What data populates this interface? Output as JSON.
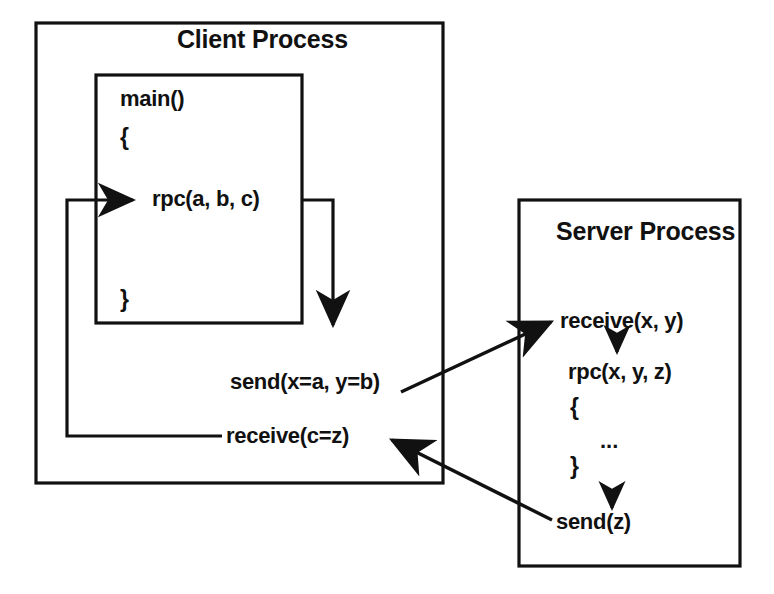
{
  "diagram": {
    "type": "sequence-flow-diagram",
    "background_color": "#ffffff",
    "stroke_color": "#111111",
    "text_color": "#111111"
  },
  "client": {
    "box_label": "Client Process",
    "main_box": {
      "function_label": "main()",
      "open_brace": "{",
      "call_label": "rpc(a, b, c)",
      "close_brace": "}"
    },
    "send_label": "send(x=a, y=b)",
    "receive_label": "receive(c=z)"
  },
  "server": {
    "box_label": "Server Process",
    "receive_label": "receive(x, y)",
    "procedure_label": "rpc(x, y, z)",
    "open_brace": "{",
    "body_ellipsis": "...",
    "close_brace": "}",
    "send_label": "send(z)"
  },
  "connectors": [
    {
      "name": "client-rpc-to-send",
      "from": "rpc(a, b, c)",
      "to": "send(x=a, y=b)",
      "style": "orthogonal",
      "arrow": "down"
    },
    {
      "name": "client-send-to-server-receive",
      "from": "send(x=a, y=b)",
      "to": "receive(x, y)",
      "style": "diagonal",
      "arrow": "up-right"
    },
    {
      "name": "server-receive-to-rpc",
      "from": "receive(x, y)",
      "to": "rpc(x, y, z)",
      "style": "vertical",
      "arrow": "down"
    },
    {
      "name": "server-rpc-to-send",
      "from": "}",
      "to": "send(z)",
      "style": "vertical",
      "arrow": "down"
    },
    {
      "name": "server-send-to-client-receive",
      "from": "send(z)",
      "to": "receive(c=z)",
      "style": "diagonal",
      "arrow": "up-left"
    },
    {
      "name": "client-receive-to-rpc",
      "from": "receive(c=z)",
      "to": "rpc(a, b, c)",
      "style": "orthogonal",
      "arrow": "right"
    }
  ]
}
